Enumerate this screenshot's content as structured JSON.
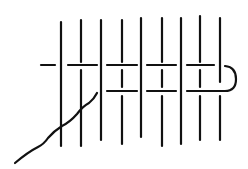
{
  "diagram": {
    "type": "stitch-illustration",
    "description": "Line drawing of a weaving/darning stitch: vertical threads with horizontal thread passing over and under, a needle thread entering from lower left, looping at right",
    "stroke_color": "#111111",
    "background": "#ffffff",
    "vertical_threads": [
      {
        "x": 61,
        "segments": [
          [
            22,
            146
          ]
        ]
      },
      {
        "x": 81,
        "segments": [
          [
            20,
            62
          ],
          [
            70,
            146
          ]
        ]
      },
      {
        "x": 101,
        "segments": [
          [
            20,
            140
          ]
        ]
      },
      {
        "x": 122,
        "segments": [
          [
            20,
            62
          ],
          [
            70,
            87
          ],
          [
            96,
            144
          ]
        ]
      },
      {
        "x": 141,
        "segments": [
          [
            18,
            137
          ]
        ]
      },
      {
        "x": 162,
        "segments": [
          [
            18,
            62
          ],
          [
            70,
            87
          ],
          [
            96,
            146
          ]
        ]
      },
      {
        "x": 181,
        "segments": [
          [
            18,
            144
          ]
        ]
      },
      {
        "x": 200,
        "segments": [
          [
            16,
            62
          ],
          [
            70,
            87
          ],
          [
            96,
            140
          ]
        ]
      },
      {
        "x": 220,
        "segments": [
          [
            18,
            82
          ],
          [
            96,
            140
          ]
        ]
      }
    ],
    "horizontal_threads": [
      {
        "y": 65,
        "segments": [
          [
            41,
            55
          ],
          [
            68,
            97
          ],
          [
            107,
            137
          ],
          [
            147,
            176
          ],
          [
            187,
            214
          ]
        ]
      },
      {
        "y": 91,
        "segments": [
          [
            107,
            137
          ],
          [
            147,
            176
          ]
        ]
      }
    ],
    "loop": {
      "path": "M187 91 L225 91 Q236 91 236 79 Q236 67 225 66"
    },
    "needle_thread": {
      "path": "M15 163 Q28 152 38 147 Q44 144 48 138 Q54 131 62 126 Q70 122 77 114 Q83 106 89 103 Q94 99 97 93"
    }
  }
}
